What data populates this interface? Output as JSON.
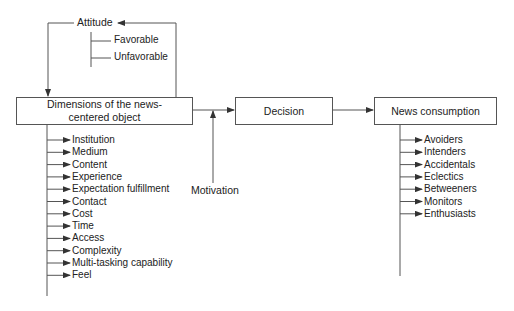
{
  "diagram": {
    "attitude": {
      "label": "Attitude",
      "options": [
        "Favorable",
        "Unfavorable"
      ]
    },
    "boxes": {
      "dimensions": "Dimensions of the news-centered object",
      "decision": "Decision",
      "consumption": "News consumption"
    },
    "motivation": "Motivation",
    "dimensions_list": [
      "Institution",
      "Medium",
      "Content",
      "Experience",
      "Expectation fulfillment",
      "Contact",
      "Cost",
      "Time",
      "Access",
      "Complexity",
      "Multi-tasking capability",
      "Feel"
    ],
    "consumer_types": [
      "Avoiders",
      "Intenders",
      "Accidentals",
      "Eclectics",
      "Betweeners",
      "Monitors",
      "Enthusiasts"
    ],
    "colors": {
      "line": "#555555",
      "text": "#222222",
      "background": "#ffffff"
    }
  }
}
